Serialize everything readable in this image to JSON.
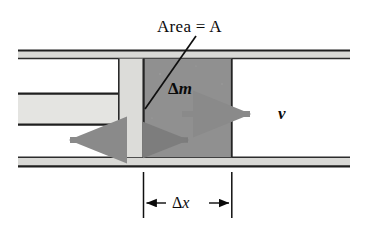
{
  "figure": {
    "type": "physics-diagram",
    "width": 367,
    "height": 234,
    "background": "#ffffff"
  },
  "labels": {
    "area": "Area = A",
    "delta_m_symbol": "Δ",
    "delta_m_var": "m",
    "velocity": "v",
    "delta_x_symbol": "Δ",
    "delta_x_var": "x"
  },
  "colors": {
    "ink": "#0a0a0a",
    "wall_fill": "#d9d9d6",
    "shaft_fill": "#e4e4e1",
    "piston_fill": "#dcdcd9",
    "fluid_fill": "#8f8f8f",
    "arrow_gray": "#8a8a8a",
    "arrow_dark_gray": "#6f6f6f",
    "outline": "#2a2a2a",
    "white": "#ffffff"
  },
  "geometry": {
    "pipe": {
      "left": 18,
      "right": 350,
      "top_wall_y": 50,
      "top_wall_height": 9,
      "bottom_wall_y": 157,
      "bottom_wall_height": 10
    },
    "shaft": {
      "left": 18,
      "right": 118,
      "top": 93,
      "bottom": 125
    },
    "piston": {
      "left": 118,
      "right": 143,
      "top": 58,
      "bottom": 157
    },
    "fluid_element": {
      "left": 143,
      "right": 232,
      "top": 58,
      "bottom": 157
    },
    "leader_line": {
      "x1": 196,
      "y1": 36,
      "x2": 146,
      "y2": 108
    },
    "velocity_arrow": {
      "x1": 182,
      "y1": 114,
      "x2": 262,
      "y2": 114
    },
    "reaction_arrow": {
      "x1": 118,
      "y1": 140,
      "x2": 60,
      "y2": 140
    },
    "small_arrow": {
      "x1": 144,
      "y1": 140,
      "x2": 200,
      "y2": 140
    },
    "dimension": {
      "left_x": 143,
      "right_x": 232,
      "ext_top": 172,
      "ext_bottom": 218,
      "line_y": 203
    }
  },
  "label_positions": {
    "area": {
      "left": 157,
      "top": 18
    },
    "delta_m": {
      "left": 168,
      "top": 80
    },
    "velocity": {
      "left": 277,
      "top": 105
    },
    "delta_x": {
      "left": 168,
      "top": 194
    }
  }
}
